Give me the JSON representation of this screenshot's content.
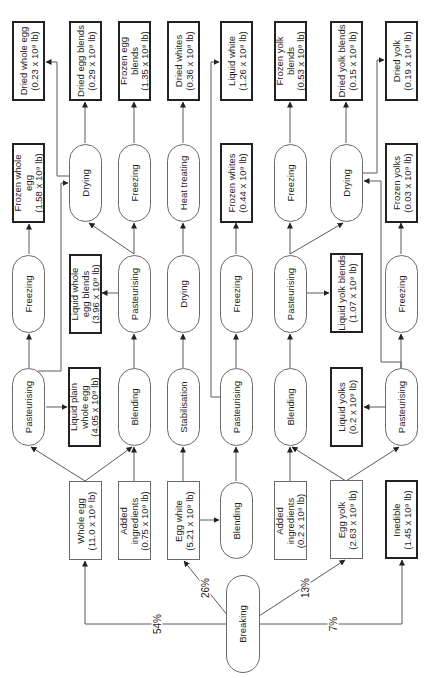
{
  "nodes": {
    "dried_whole_egg": {
      "label": "Dried whole egg",
      "qty": "(0.23 x 10⁹ lb)"
    },
    "dried_egg_blends": {
      "label": "Dried egg blends",
      "qty": "(0.29 x 10⁹ lb)"
    },
    "frozen_egg_blends": {
      "label": "Frozen egg\nblends",
      "qty": "(1.35 x 10⁹ lb)"
    },
    "dried_whites": {
      "label": "Dried whites",
      "qty": "(0.36 x 10⁹ lb)"
    },
    "liquid_white": {
      "label": "Liquid white",
      "qty": "(1.26 x 10⁹ lb)"
    },
    "frozen_yolk_blends": {
      "label": "Frozen yolk\nblends",
      "qty": "(0.53 x 10⁹ lb)"
    },
    "dried_yolk_blends": {
      "label": "Dried yolk blends",
      "qty": "(0.15 x 10⁹ lb)"
    },
    "dried_yolk": {
      "label": "Dried yolk",
      "qty": "(0.19 x 10⁹ lb)"
    },
    "frozen_whole_egg": {
      "label": "Frozen whole\negg",
      "qty": "(1.58 x 10⁹ lb)"
    },
    "drying_egg_blends": {
      "label": "Drying"
    },
    "freezing_egg_blends": {
      "label": "Freezing"
    },
    "heat_treating": {
      "label": "Heat treating"
    },
    "frozen_whites": {
      "label": "Frozen whites",
      "qty": "(0.44 x 10⁹ lb)"
    },
    "freezing_yolk_blends": {
      "label": "Freezing"
    },
    "drying_yolk": {
      "label": "Drying"
    },
    "frozen_yolks": {
      "label": "Frozen yolks",
      "qty": "(0.03 x 10⁹ lb)"
    },
    "freezing_whole_egg": {
      "label": "Freezing"
    },
    "liquid_whole_egg_blends": {
      "label": "Liquid whole\negg blends",
      "qty": "(3.96 x 10⁹ lb)"
    },
    "pasteurising_egg_blends": {
      "label": "Pasteurising"
    },
    "drying_whites": {
      "label": "Drying"
    },
    "freezing_whites": {
      "label": "Freezing"
    },
    "pasteurising_yolk_blends": {
      "label": "Pasteurising"
    },
    "liquid_yolk_blends": {
      "label": "Liquid yolk blends",
      "qty": "(1.07 x 10⁹ lb)"
    },
    "freezing_yolks": {
      "label": "Freezing"
    },
    "pasteurising_whole_egg": {
      "label": "Pasteurising"
    },
    "liquid_plain_whole_egg": {
      "label": "Liquid plain\nwhole egg",
      "qty": "(4.05 x 10⁹ lb)"
    },
    "blending_whole_egg": {
      "label": "Blending"
    },
    "stabilisation": {
      "label": "Stabilisation"
    },
    "pasteurising_whites": {
      "label": "Pasteurising"
    },
    "blending_yolk": {
      "label": "Blending"
    },
    "liquid_yolks": {
      "label": "Liquid yolks",
      "qty": "(0.2 x 10⁹ lb)"
    },
    "pasteurising_yolks": {
      "label": "Pasteurising"
    },
    "whole_egg": {
      "label": "Whole egg",
      "qty": "(11.0 x 10⁹ lb)"
    },
    "added_ingredients_1": {
      "label": "Added\ningredients",
      "qty": "(0.75 x 10⁹ lb)"
    },
    "egg_white": {
      "label": "Egg white",
      "qty": "(5.21 x 10⁹ lb)"
    },
    "blending_whites": {
      "label": "Blending"
    },
    "added_ingredients_2": {
      "label": "Added\ningredients",
      "qty": "(0.2 x 10⁹ lb)"
    },
    "egg_yolk": {
      "label": "Egg yolk",
      "qty": "(2.63 x 10⁹ lb)"
    },
    "inedible": {
      "label": "Inedible",
      "qty": "(1.45 x 10⁹ lb)"
    },
    "breaking": {
      "label": "Breaking"
    }
  },
  "percentages": {
    "whole_egg": "54%",
    "egg_white": "26%",
    "egg_yolk": "13%",
    "inedible": "7%"
  },
  "edges": [
    {
      "from": "breaking",
      "to": "whole_egg",
      "label": "54%"
    },
    {
      "from": "breaking",
      "to": "egg_white",
      "label": "26%"
    },
    {
      "from": "breaking",
      "to": "egg_yolk",
      "label": "13%"
    },
    {
      "from": "breaking",
      "to": "inedible",
      "label": "7%"
    },
    {
      "from": "whole_egg",
      "to": "pasteurising_whole_egg"
    },
    {
      "from": "whole_egg",
      "to": "blending_whole_egg"
    },
    {
      "from": "added_ingredients_1",
      "to": "blending_whole_egg"
    },
    {
      "from": "egg_white",
      "to": "stabilisation"
    },
    {
      "from": "egg_white",
      "to": "blending_whites"
    },
    {
      "from": "blending_whites",
      "to": "pasteurising_whites"
    },
    {
      "from": "added_ingredients_2",
      "to": "blending_yolk"
    },
    {
      "from": "egg_yolk",
      "to": "blending_yolk"
    },
    {
      "from": "egg_yolk",
      "to": "pasteurising_yolks"
    },
    {
      "from": "pasteurising_whole_egg",
      "to": "liquid_plain_whole_egg"
    },
    {
      "from": "pasteurising_whole_egg",
      "to": "freezing_whole_egg"
    },
    {
      "from": "pasteurising_whole_egg",
      "to": "drying_egg_blends"
    },
    {
      "from": "freezing_whole_egg",
      "to": "frozen_whole_egg"
    },
    {
      "from": "drying_egg_blends",
      "to": "dried_egg_blends"
    },
    {
      "from": "drying_egg_blends",
      "to": "dried_whole_egg"
    },
    {
      "from": "blending_whole_egg",
      "to": "pasteurising_egg_blends"
    },
    {
      "from": "pasteurising_egg_blends",
      "to": "liquid_whole_egg_blends"
    },
    {
      "from": "pasteurising_egg_blends",
      "to": "freezing_egg_blends"
    },
    {
      "from": "pasteurising_egg_blends",
      "to": "drying_egg_blends"
    },
    {
      "from": "freezing_egg_blends",
      "to": "frozen_egg_blends"
    },
    {
      "from": "stabilisation",
      "to": "drying_whites"
    },
    {
      "from": "drying_whites",
      "to": "heat_treating"
    },
    {
      "from": "heat_treating",
      "to": "dried_whites"
    },
    {
      "from": "pasteurising_whites",
      "to": "freezing_whites"
    },
    {
      "from": "pasteurising_whites",
      "to": "liquid_white"
    },
    {
      "from": "freezing_whites",
      "to": "frozen_whites"
    },
    {
      "from": "blending_yolk",
      "to": "pasteurising_yolk_blends"
    },
    {
      "from": "pasteurising_yolk_blends",
      "to": "liquid_yolk_blends"
    },
    {
      "from": "pasteurising_yolk_blends",
      "to": "freezing_yolk_blends"
    },
    {
      "from": "pasteurising_yolk_blends",
      "to": "drying_yolk"
    },
    {
      "from": "freezing_yolk_blends",
      "to": "frozen_yolk_blends"
    },
    {
      "from": "drying_yolk",
      "to": "dried_yolk_blends"
    },
    {
      "from": "drying_yolk",
      "to": "dried_yolk"
    },
    {
      "from": "pasteurising_yolks",
      "to": "drying_yolk"
    },
    {
      "from": "pasteurising_yolks",
      "to": "liquid_yolks"
    },
    {
      "from": "pasteurising_yolks",
      "to": "freezing_yolks"
    },
    {
      "from": "freezing_yolks",
      "to": "frozen_yolks"
    }
  ],
  "colors": {
    "line": "#5a5a5a",
    "thick_border": "#222222",
    "background": "#ffffff"
  }
}
